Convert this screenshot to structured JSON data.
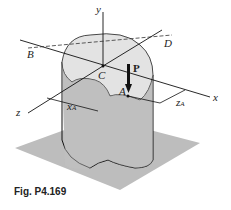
{
  "figure": {
    "caption": "Fig. P4.169",
    "axes": {
      "x": "x",
      "y": "y",
      "z": "z"
    },
    "points": {
      "B": "B",
      "C": "C",
      "D": "D",
      "A": "A"
    },
    "load": "P",
    "dimensions": {
      "xA_main": "x",
      "xA_sub": "A",
      "zA_main": "z",
      "zA_sub": "A"
    }
  }
}
